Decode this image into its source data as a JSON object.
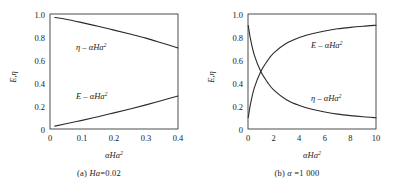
{
  "figure": {
    "panel_a": {
      "caption_prefix": "(a)",
      "caption_symbol": "Ha",
      "caption_value": "=0.02",
      "xlabel_base": "αHa",
      "xlabel_sup": "2",
      "ylabel": "E,η",
      "xticks": [
        "0",
        "0.1",
        "0.2",
        "0.3",
        "0.4"
      ],
      "yticks": [
        "1.0",
        "0.8",
        "0.6",
        "0.4",
        "0.2",
        "0"
      ],
      "curve1_label_base": "η – αHa",
      "curve1_label_sup": "2",
      "curve2_label_base": "E – αHa",
      "curve2_label_sup": "2"
    },
    "panel_b": {
      "caption_prefix": "(b)",
      "caption_symbol": "α",
      "caption_value": "=1 000",
      "xlabel_base": "αHa",
      "xlabel_sup": "2",
      "ylabel": "E,η",
      "xticks": [
        "0",
        "2",
        "4",
        "6",
        "8",
        "10"
      ],
      "yticks": [
        "1.0",
        "0.8",
        "0.6",
        "0.4",
        "0.2",
        "0"
      ],
      "curve1_label_base": "E – αHa",
      "curve1_label_sup": "2",
      "curve2_label_base": "η – αHa",
      "curve2_label_sup": "2"
    }
  },
  "chart_data": [
    {
      "type": "line",
      "panel": "(a) Ha=0.02",
      "title": "",
      "xlabel": "αHa²",
      "ylabel": "E,η",
      "xlim": [
        0,
        0.4
      ],
      "ylim": [
        0,
        1.0
      ],
      "xticks": [
        0,
        0.1,
        0.2,
        0.3,
        0.4
      ],
      "yticks": [
        0,
        0.2,
        0.4,
        0.6,
        0.8,
        1.0
      ],
      "grid": false,
      "legend": "inline-annotations",
      "series": [
        {
          "name": "η – αHa²",
          "x": [
            0.015,
            0.05,
            0.1,
            0.15,
            0.2,
            0.25,
            0.3,
            0.35,
            0.4
          ],
          "values": [
            0.97,
            0.955,
            0.925,
            0.893,
            0.86,
            0.826,
            0.79,
            0.748,
            0.705
          ]
        },
        {
          "name": "E – αHa²",
          "x": [
            0.015,
            0.05,
            0.1,
            0.15,
            0.2,
            0.25,
            0.3,
            0.35,
            0.4
          ],
          "values": [
            0.025,
            0.045,
            0.075,
            0.107,
            0.14,
            0.174,
            0.21,
            0.248,
            0.287
          ]
        }
      ]
    },
    {
      "type": "line",
      "panel": "(b) α =1 000",
      "title": "",
      "xlabel": "αHa²",
      "ylabel": "E,η",
      "xlim": [
        0,
        10
      ],
      "ylim": [
        0,
        1.0
      ],
      "xticks": [
        0,
        2,
        4,
        6,
        8,
        10
      ],
      "yticks": [
        0,
        0.2,
        0.4,
        0.6,
        0.8,
        1.0
      ],
      "grid": false,
      "legend": "inline-annotations",
      "series": [
        {
          "name": "E – αHa²",
          "x": [
            0.02,
            0.2,
            0.5,
            1.0,
            1.5,
            2.0,
            3.0,
            4.0,
            5.0,
            6.0,
            7.0,
            8.0,
            9.0,
            10.0
          ],
          "values": [
            0.1,
            0.22,
            0.36,
            0.5,
            0.59,
            0.66,
            0.745,
            0.795,
            0.828,
            0.852,
            0.871,
            0.884,
            0.894,
            0.902
          ]
        },
        {
          "name": "η – αHa²",
          "x": [
            0.02,
            0.2,
            0.5,
            1.0,
            1.5,
            2.0,
            3.0,
            4.0,
            5.0,
            6.0,
            7.0,
            8.0,
            9.0,
            10.0
          ],
          "values": [
            0.9,
            0.78,
            0.64,
            0.5,
            0.41,
            0.34,
            0.255,
            0.205,
            0.172,
            0.148,
            0.129,
            0.116,
            0.106,
            0.098
          ]
        }
      ]
    }
  ]
}
